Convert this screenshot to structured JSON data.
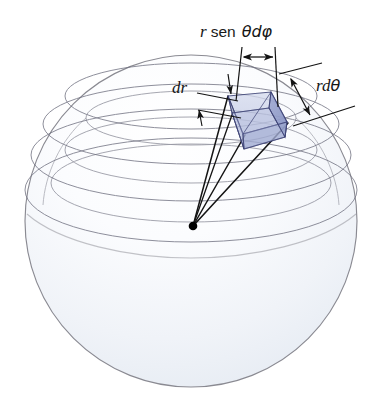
{
  "figure": {
    "background_color": "#ffffff"
  },
  "labels": {
    "arc_phi": {
      "id": "r-sen-theta-d-phi",
      "parts": {
        "r": "r",
        "sen": "sen",
        "theta_d_phi": "θdφ"
      },
      "full_text": "r sen θdφ",
      "x": 248,
      "y": 31
    },
    "radial": {
      "id": "dr",
      "full_text": "dr",
      "x": 178,
      "y": 88
    },
    "arc_theta": {
      "id": "r-d-theta",
      "parts": {
        "rd": "rd",
        "theta": "θ"
      },
      "full_text": "rdθ",
      "x": 320,
      "y": 87
    }
  },
  "colors": {
    "sphere_outline": "#8a8a92",
    "sphere_fill_top": "#fbfcfe",
    "sphere_fill_bottom": "#e8edf4",
    "latitude_line": "#6f7080",
    "element_face_front": "#b7bfdd",
    "element_face_right": "#8a95c4",
    "element_face_top": "#c6cde6",
    "element_edge": "#3a3f72",
    "ray_line": "#151515",
    "center_dot": "#000000",
    "leader_line": "#141414",
    "label_text": "#161616"
  },
  "geometry": {
    "sphere": {
      "cx": 191,
      "cy": 221,
      "r": 166
    },
    "center_point": {
      "x": 193,
      "y": 226,
      "radius": 4.2
    },
    "latitude_circles": [
      {
        "cx": 191,
        "cy": 95,
        "rx": 132,
        "ry": 34
      },
      {
        "cx": 191,
        "cy": 122,
        "rx": 150,
        "ry": 40
      },
      {
        "cx": 191,
        "cy": 152,
        "rx": 160,
        "ry": 45
      },
      {
        "cx": 191,
        "cy": 186,
        "rx": 165,
        "ry": 50
      },
      {
        "cx": 191,
        "cy": 119,
        "rx": 110,
        "ry": 28
      },
      {
        "cx": 191,
        "cy": 150,
        "rx": 128,
        "ry": 34
      },
      {
        "cx": 191,
        "cy": 180,
        "rx": 140,
        "ry": 38
      }
    ],
    "volume_element": {
      "outer_face": [
        [
          228,
          96
        ],
        [
          271,
          92
        ],
        [
          287,
          122
        ],
        [
          243,
          134
        ]
      ],
      "inner_face": [
        [
          232,
          113
        ],
        [
          272,
          109
        ],
        [
          285,
          136
        ],
        [
          244,
          148
        ]
      ],
      "rays": [
        [
          [
            193,
            226
          ],
          [
            228,
            96
          ]
        ],
        [
          [
            193,
            226
          ],
          [
            232,
            113
          ]
        ],
        [
          [
            193,
            226
          ],
          [
            243,
            134
          ]
        ],
        [
          [
            193,
            226
          ],
          [
            287,
            122
          ]
        ]
      ]
    },
    "dimension_arc_phi": {
      "left_line": {
        "x": 242,
        "y1": 48,
        "y2": 100
      },
      "right_line": {
        "x": 272,
        "y1": 48,
        "y2": 103
      },
      "arrow": {
        "x1": 242,
        "x2": 272,
        "y": 57
      }
    },
    "dimension_dr": {
      "upper_line": [
        [
          196,
          92
        ],
        [
          236,
          100
        ]
      ],
      "lower_line": [
        [
          196,
          108
        ],
        [
          240,
          116
        ]
      ],
      "arrow_down": [
        [
          226,
          76
        ],
        [
          230,
          92
        ]
      ],
      "arrow_up": [
        [
          204,
          122
        ],
        [
          200,
          108
        ]
      ]
    },
    "dimension_r_d_theta": {
      "upper_line": [
        [
          281,
          72
        ],
        [
          318,
          64
        ]
      ],
      "lower_line": [
        [
          296,
          123
        ],
        [
          352,
          107
        ]
      ],
      "arrow": [
        [
          292,
          78
        ],
        [
          312,
          112
        ]
      ]
    }
  },
  "annotations": {
    "count_latitude_circles": 7,
    "count_rays": 4,
    "element_faces": 3
  }
}
